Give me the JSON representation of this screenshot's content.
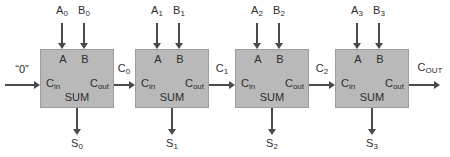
{
  "diagram": {
    "colors": {
      "background": "#ffffff",
      "box_fill": "#b9b9b9",
      "box_border": "#9c9c9c",
      "text": "#2e2e2e",
      "arrow": "#4a4a4a"
    },
    "carry_in": {
      "label": "“0”"
    },
    "box_ports": {
      "a": "A",
      "b": "B",
      "cin": {
        "main": "C",
        "sub": "in"
      },
      "cout": {
        "main": "C",
        "sub": "out"
      },
      "sum": "SUM"
    },
    "stages": [
      {
        "a": {
          "main": "A",
          "sub": "0"
        },
        "b": {
          "main": "B",
          "sub": "0"
        },
        "sum": {
          "main": "S",
          "sub": "0"
        },
        "carry_out": {
          "main": "C",
          "sub": "0"
        }
      },
      {
        "a": {
          "main": "A",
          "sub": "1"
        },
        "b": {
          "main": "B",
          "sub": "1"
        },
        "sum": {
          "main": "S",
          "sub": "1"
        },
        "carry_out": {
          "main": "C",
          "sub": "1"
        }
      },
      {
        "a": {
          "main": "A",
          "sub": "2"
        },
        "b": {
          "main": "B",
          "sub": "2"
        },
        "sum": {
          "main": "S",
          "sub": "2"
        },
        "carry_out": {
          "main": "C",
          "sub": "2"
        }
      },
      {
        "a": {
          "main": "A",
          "sub": "3"
        },
        "b": {
          "main": "B",
          "sub": "3"
        },
        "sum": {
          "main": "S",
          "sub": "3"
        },
        "carry_out": {
          "main": "C",
          "sub": "OUT"
        }
      }
    ]
  }
}
